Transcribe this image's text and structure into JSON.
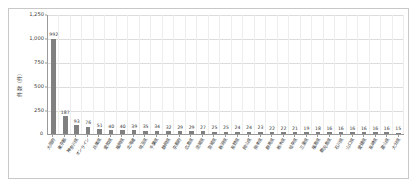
{
  "chart_data": {
    "type": "bar",
    "title": "",
    "xlabel": "",
    "ylabel": "件数（件）",
    "ylim": [
      0,
      1250
    ],
    "ytick_values": [
      0,
      250,
      500,
      750,
      1000,
      1250
    ],
    "ytick_labels": [
      "0",
      "250",
      "500",
      "750",
      "1,000",
      "1,250"
    ],
    "grid": true,
    "legend": false,
    "bar_color": "#808080",
    "categories": [
      "大阪府",
      "東京都",
      "神奈川県",
      "オンライン",
      "兵庫県",
      "愛知県",
      "福岡県",
      "北海道",
      "埼玉県",
      "千葉県",
      "静岡県",
      "京都府",
      "広島県",
      "茨城県",
      "宮城県",
      "新潟県",
      "長野県",
      "岡山県",
      "熊本県",
      "群馬県",
      "栃木県",
      "岐阜県",
      "三重県",
      "福島県",
      "鹿児島県",
      "石川県",
      "山口県",
      "愛媛県",
      "長崎県",
      "富山県",
      "大分県"
    ],
    "values": [
      992,
      187,
      93,
      76,
      51,
      40,
      40,
      39,
      35,
      34,
      32,
      29,
      29,
      27,
      25,
      25,
      24,
      24,
      23,
      22,
      22,
      21,
      19,
      18,
      16,
      16,
      16,
      16,
      16,
      16,
      15
    ],
    "value_labels": [
      "992",
      "187",
      "93",
      "76",
      "51",
      "40",
      "40",
      "39",
      "35",
      "34",
      "32",
      "29",
      "29",
      "27",
      "25",
      "25",
      "24",
      "24",
      "23",
      "22",
      "22",
      "21",
      "19",
      "18",
      "16",
      "16",
      "16",
      "16",
      "16",
      "16",
      "15"
    ]
  }
}
